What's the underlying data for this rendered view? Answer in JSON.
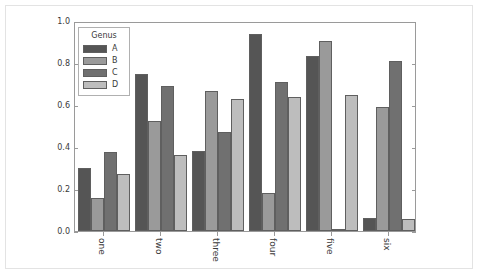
{
  "chart_data": {
    "type": "bar",
    "title": "",
    "xlabel": "",
    "ylabel": "",
    "categories": [
      "one",
      "two",
      "three",
      "four",
      "five",
      "six"
    ],
    "series": [
      {
        "name": "A",
        "color": "#555555",
        "values": [
          0.3,
          0.75,
          0.38,
          0.94,
          0.835,
          0.06
        ]
      },
      {
        "name": "B",
        "color": "#9a9a9a",
        "values": [
          0.155,
          0.525,
          0.665,
          0.18,
          0.905,
          0.59
        ]
      },
      {
        "name": "C",
        "color": "#707070",
        "values": [
          0.375,
          0.69,
          0.47,
          0.71,
          0.01,
          0.81
        ]
      },
      {
        "name": "D",
        "color": "#bdbdbd",
        "values": [
          0.27,
          0.36,
          0.63,
          0.64,
          0.65,
          0.055
        ]
      }
    ],
    "ylim": [
      0.0,
      1.0
    ],
    "yticks": [
      "0.0",
      "0.2",
      "0.4",
      "0.6",
      "0.8",
      "1.0"
    ],
    "ytick_values": [
      0.0,
      0.2,
      0.4,
      0.6,
      0.8,
      1.0
    ],
    "grid": false,
    "legend": {
      "title": "Genus",
      "position": "upper left",
      "entries": [
        "A",
        "B",
        "C",
        "D"
      ]
    },
    "xtick_rotation": 90,
    "bar_edge_color": "#5f5f5f",
    "axes_color": "#9a9a9a",
    "background": "#ffffff"
  }
}
